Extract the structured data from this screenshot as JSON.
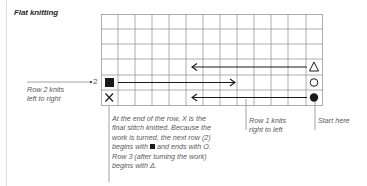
{
  "title": "Flat knitting",
  "grid": {
    "columns": 13,
    "rows": 6,
    "symbols": {
      "row_3_start": "triangle-open",
      "row_2_start": "square-filled",
      "row_2_end": "circle-open",
      "row_1_start": "circle-filled",
      "row_1_end": "x-cross"
    }
  },
  "row_number_label": "2",
  "annotations": {
    "row2": "Row 2 knits left to right",
    "row2_line1": "Row 2 knits",
    "row2_line2": "left to right",
    "explain_line1": "At the end of the row, X is the",
    "explain_line2": "final stitch knitted. Because the",
    "explain_line3": "work is turned, the next row (2)",
    "explain_line4a": "begins with",
    "explain_line4b": "and ends with O.",
    "explain_line5": "Row 3 (after turning the work)",
    "explain_line6": "begins with Δ.",
    "row1_line1": "Row 1 knits",
    "row1_line2": "right to left",
    "start": "Start here"
  },
  "colors": {
    "grid_line": "#9a9a9a",
    "ink": "#1a1a1a",
    "leader": "#8a8a8a"
  }
}
